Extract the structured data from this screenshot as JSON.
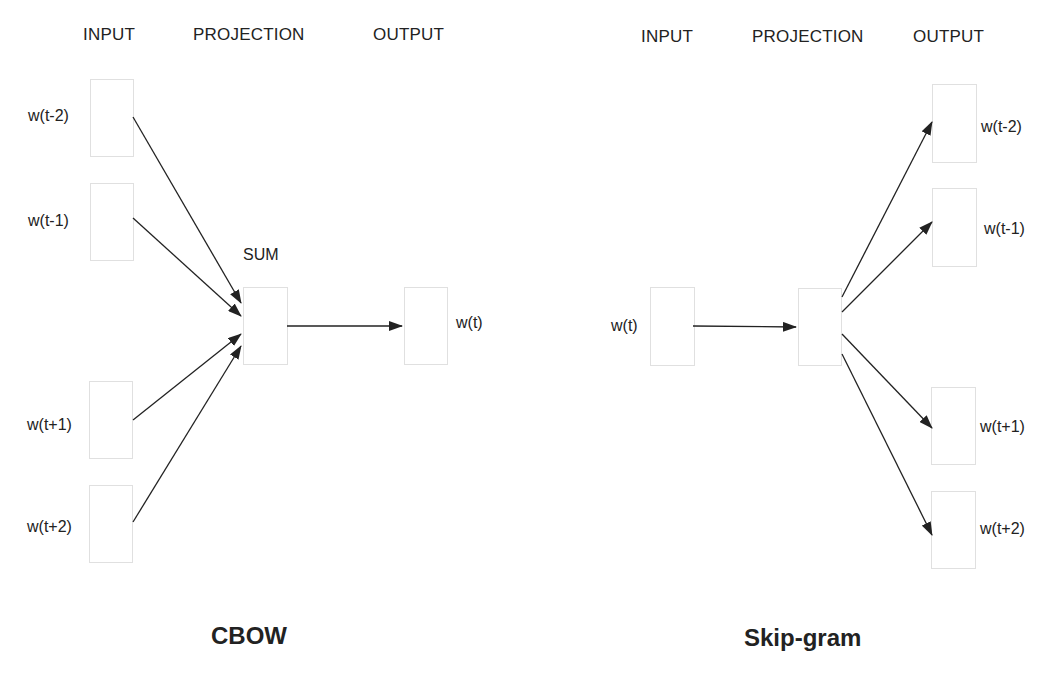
{
  "cbow": {
    "title": "CBOW",
    "headers": {
      "input": "INPUT",
      "projection": "PROJECTION",
      "output": "OUTPUT"
    },
    "projection_label": "SUM",
    "inputs": [
      "w(t-2)",
      "w(t-1)",
      "w(t+1)",
      "w(t+2)"
    ],
    "output": "w(t)"
  },
  "skipgram": {
    "title": "Skip-gram",
    "headers": {
      "input": "INPUT",
      "projection": "PROJECTION",
      "output": "OUTPUT"
    },
    "input": "w(t)",
    "outputs": [
      "w(t-2)",
      "w(t-1)",
      "w(t+1)",
      "w(t+2)"
    ]
  },
  "colors": {
    "line": "#222222",
    "box_border": "#e0e0e0",
    "text": "#222222"
  }
}
